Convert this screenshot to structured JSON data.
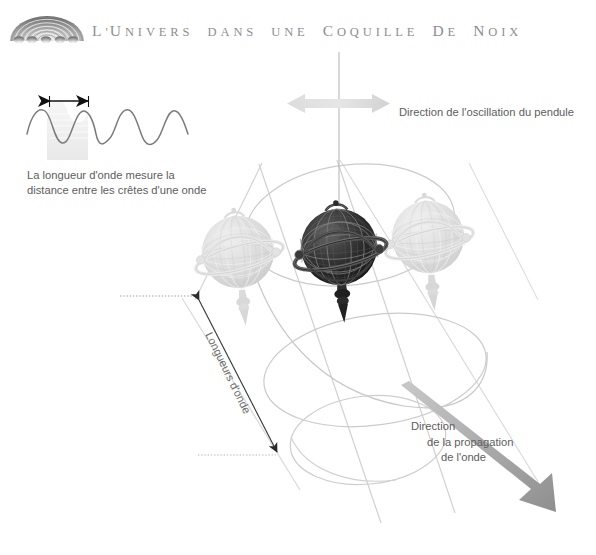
{
  "page": {
    "width": 596,
    "height": 555,
    "background": "#ffffff",
    "kind": "book-illustration"
  },
  "header": {
    "logo_name": "nutshell-arcs-logo",
    "title_full": "L'UNIVERS DANS UNE COQUILLE DE NOIX",
    "title_parts": {
      "l": "L",
      "apostrophe": "'",
      "u": "U",
      "nivers": "NIVERS",
      "dans": "DANS",
      "une": "UNE",
      "c": "C",
      "oquille": "OQUILLE",
      "d": "D",
      "e": "E",
      "n": "N",
      "oix": "OIX"
    },
    "title_color": "#8e8e90"
  },
  "wave_inset": {
    "caption_line1": "La longueur d'onde mesure la",
    "caption_line2": "distance entre les crêtes d'une onde",
    "arrow_name": "wavelength-measure-arrow",
    "wave_name": "sine-wave-curve",
    "cycles": 3.5,
    "wave_color": "#7b7b7b",
    "arrow_color": "#1a1a1a",
    "shade_color": "#ececec"
  },
  "labels": {
    "oscillation": "Direction de l'oscillation du pendule",
    "propagation_line1": "Direction",
    "propagation_line2": "de la propagation",
    "propagation_line3": "de l'onde",
    "wavelength": "Longueurs d'onde",
    "text_color": "#5d5d5d"
  },
  "diagram": {
    "suspension_wire_name": "pendulum-suspension-wire",
    "oscillation_arrow_name": "oscillation-double-arrow",
    "oscillation_arrow_color": "#d8d8d8",
    "propagation_arrow_name": "propagation-thick-arrow",
    "propagation_arrow_color": "#9a9a9a",
    "wavelength_arrow_name": "wavelength-double-arrow",
    "wavelength_arrow_color": "#3a3a3a",
    "dotted_leader_color": "#9b9b9b",
    "helix_color": "#cfcfcf",
    "envelope_color": "#d5d5d5",
    "globes": [
      {
        "name": "globe-ghost-left",
        "state": "faded",
        "fill": "#dcdcdc"
      },
      {
        "name": "globe-center",
        "state": "solid",
        "fill": "#2b2b2b"
      },
      {
        "name": "globe-ghost-right",
        "state": "faded",
        "fill": "#d9d9d9"
      }
    ]
  }
}
